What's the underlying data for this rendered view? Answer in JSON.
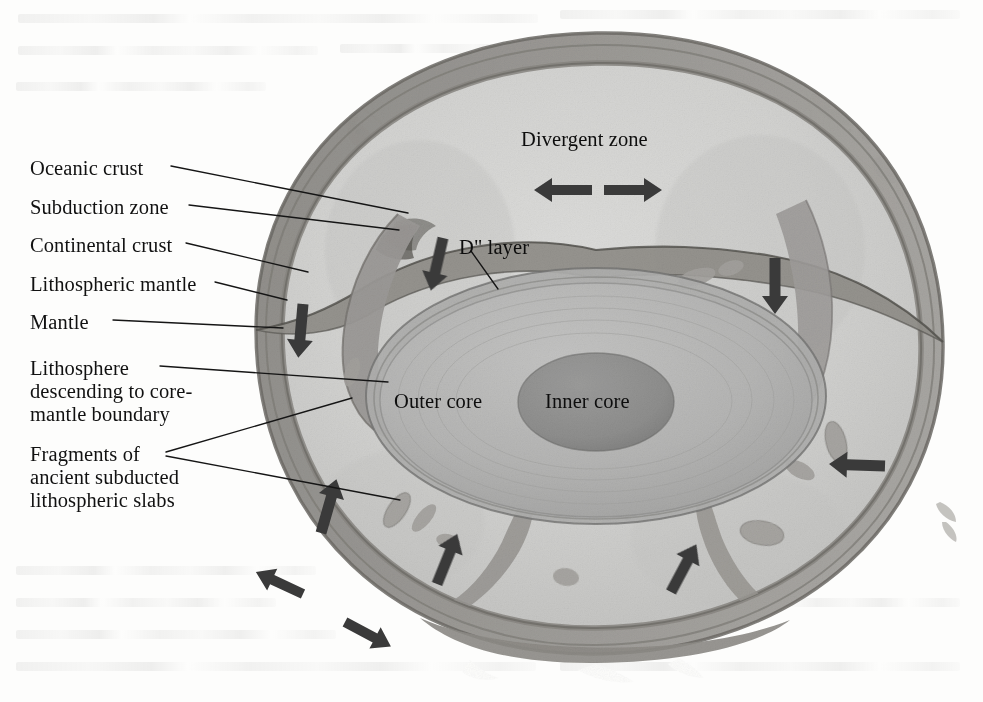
{
  "figure": {
    "type": "earth-cross-section-cutaway",
    "background_color": "#fdfdfc",
    "palette": {
      "crust_surface": "#b0aeab",
      "crust_dark": "#8a8885",
      "lithosphere": "#9d9b98",
      "mantle": "#cdcdcd",
      "mantle_light": "#d8d8d6",
      "outer_core": "#b5b5b5",
      "inner_core": "#8e8e8e",
      "slab": "#9a9a9a",
      "arrow": "#3a3a3a",
      "leader_line": "#1a1a1a",
      "text": "#111111"
    }
  },
  "labels": {
    "left_column": [
      {
        "id": "oceanic-crust",
        "text": "Oceanic crust",
        "x": 30,
        "y": 157
      },
      {
        "id": "subduction-zone",
        "text": "Subduction zone",
        "x": 30,
        "y": 196
      },
      {
        "id": "continental-crust",
        "text": "Continental crust",
        "x": 30,
        "y": 234
      },
      {
        "id": "lithospheric-mantle",
        "text": "Lithospheric mantle",
        "x": 30,
        "y": 273
      },
      {
        "id": "mantle",
        "text": "Mantle",
        "x": 30,
        "y": 311
      }
    ],
    "left_blocks": [
      {
        "id": "lithosphere-descending",
        "text": "Lithosphere\ndescending to core-\nmantle boundary",
        "x": 30,
        "y": 357
      },
      {
        "id": "fragments-of-slabs",
        "text": "Fragments of\nancient subducted\nlithospheric slabs",
        "x": 30,
        "y": 443
      }
    ],
    "interior": [
      {
        "id": "divergent-zone",
        "text": "Divergent zone",
        "x": 521,
        "y": 128
      },
      {
        "id": "d-double-prime-layer",
        "text": "D\" layer",
        "x": 459,
        "y": 236
      },
      {
        "id": "outer-core",
        "text": "Outer core",
        "x": 394,
        "y": 390
      },
      {
        "id": "inner-core",
        "text": "Inner core",
        "x": 545,
        "y": 390
      }
    ]
  },
  "leader_lines": [
    {
      "id": "leader-oceanic-crust",
      "points": "171,166 408,213"
    },
    {
      "id": "leader-subduction-zone",
      "points": "189,205 399,230"
    },
    {
      "id": "leader-continental-crust",
      "points": "186,243 308,272"
    },
    {
      "id": "leader-lithospheric-mantle",
      "points": "215,282 287,300"
    },
    {
      "id": "leader-mantle",
      "points": "113,320 283,328"
    },
    {
      "id": "leader-lithosphere-desc",
      "points": "160,366 388,382"
    },
    {
      "id": "leader-fragments-a",
      "points": "166,452 352,398"
    },
    {
      "id": "leader-fragments-b",
      "points": "166,456 400,500"
    },
    {
      "id": "leader-d-layer",
      "points": "471,251 498,289"
    }
  ],
  "arrows": [
    {
      "id": "arrow-divergent-left",
      "x": 592,
      "y": 190,
      "angle": 180,
      "length": 58,
      "style": "thick"
    },
    {
      "id": "arrow-divergent-right",
      "x": 604,
      "y": 190,
      "angle": 0,
      "length": 58,
      "style": "thick"
    },
    {
      "id": "arrow-subduct-left-upper",
      "x": 443,
      "y": 238,
      "angle": 103,
      "length": 54,
      "style": "thick"
    },
    {
      "id": "arrow-downwelling-left",
      "x": 303,
      "y": 304,
      "angle": 95,
      "length": 54,
      "style": "thick"
    },
    {
      "id": "arrow-downwelling-right",
      "x": 775,
      "y": 258,
      "angle": 90,
      "length": 56,
      "style": "thick"
    },
    {
      "id": "arrow-upwelling-left",
      "x": 321,
      "y": 533,
      "angle": -74,
      "length": 56,
      "style": "thick"
    },
    {
      "id": "arrow-spread-left-a",
      "x": 303,
      "y": 594,
      "angle": 205,
      "length": 52,
      "style": "thick"
    },
    {
      "id": "arrow-spread-left-b",
      "x": 345,
      "y": 622,
      "angle": 28,
      "length": 52,
      "style": "thick"
    },
    {
      "id": "arrow-upwelling-mid",
      "x": 437,
      "y": 584,
      "angle": -68,
      "length": 54,
      "style": "thick"
    },
    {
      "id": "arrow-upwelling-right",
      "x": 671,
      "y": 592,
      "angle": -62,
      "length": 54,
      "style": "thick"
    },
    {
      "id": "arrow-convergence-right",
      "x": 885,
      "y": 466,
      "angle": 182,
      "length": 56,
      "style": "thick"
    }
  ],
  "slab_fragments": [
    {
      "id": "slab-fragment-1",
      "cx": 352,
      "cy": 372,
      "rx": 7,
      "ry": 15,
      "rot": 18
    },
    {
      "id": "slab-fragment-2",
      "cx": 379,
      "cy": 403,
      "rx": 6,
      "ry": 13,
      "rot": 24
    },
    {
      "id": "slab-fragment-3",
      "cx": 397,
      "cy": 510,
      "rx": 9,
      "ry": 20,
      "rot": 34
    },
    {
      "id": "slab-fragment-4",
      "cx": 424,
      "cy": 518,
      "rx": 7,
      "ry": 17,
      "rot": 40
    },
    {
      "id": "slab-fragment-5",
      "cx": 448,
      "cy": 541,
      "rx": 12,
      "ry": 7,
      "rot": 12
    },
    {
      "id": "slab-fragment-6",
      "cx": 566,
      "cy": 577,
      "rx": 13,
      "ry": 9,
      "rot": 8
    },
    {
      "id": "slab-fragment-7",
      "cx": 697,
      "cy": 277,
      "rx": 19,
      "ry": 8,
      "rot": -16
    },
    {
      "id": "slab-fragment-8",
      "cx": 731,
      "cy": 268,
      "rx": 13,
      "ry": 7,
      "rot": -18
    },
    {
      "id": "slab-fragment-9",
      "cx": 802,
      "cy": 377,
      "rx": 7,
      "ry": 18,
      "rot": -8
    },
    {
      "id": "slab-fragment-10",
      "cx": 836,
      "cy": 442,
      "rx": 10,
      "ry": 21,
      "rot": -14
    },
    {
      "id": "slab-fragment-11",
      "cx": 800,
      "cy": 470,
      "rx": 16,
      "ry": 8,
      "rot": 28
    },
    {
      "id": "slab-fragment-12",
      "cx": 762,
      "cy": 533,
      "rx": 22,
      "ry": 12,
      "rot": 10
    }
  ]
}
